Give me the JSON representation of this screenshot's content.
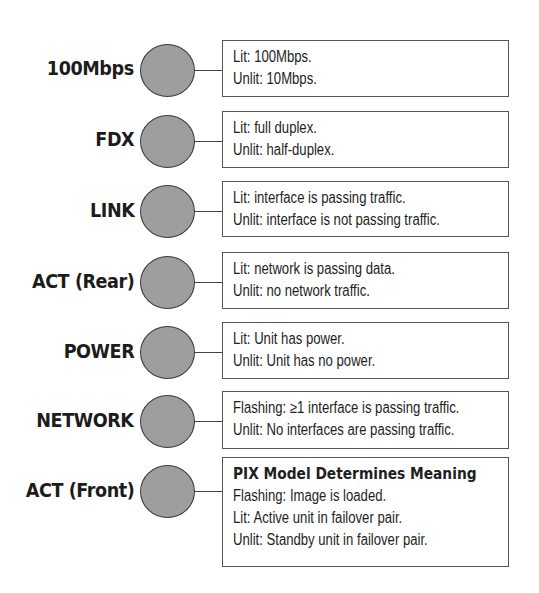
{
  "diagram": {
    "type": "LED indicator legend",
    "indicators": [
      {
        "label": "100Mbps",
        "lines": [
          "Lit: 100Mbps.",
          "Unlit:  10Mbps."
        ]
      },
      {
        "label": "FDX",
        "lines": [
          "Lit:  full duplex.",
          "Unlit:  half-duplex."
        ]
      },
      {
        "label": "LINK",
        "lines": [
          "Lit:  interface is passing traffic.",
          "Unlit: interface is not passing traffic."
        ]
      },
      {
        "label": "ACT (Rear)",
        "lines": [
          "Lit: network is passing data.",
          "Unlit:  no network traffic."
        ]
      },
      {
        "label": "POWER",
        "lines": [
          "Lit: Unit has power.",
          "Unlit:  Unit has no power."
        ]
      },
      {
        "label": "NETWORK",
        "lines": [
          "Flashing: ≥1 interface is passing traffic.",
          "Unlit:  No interfaces are passing traffic."
        ]
      },
      {
        "label": "ACT (Front)",
        "title": "PIX Model Determines Meaning",
        "lines": [
          "Flashing: Image is loaded.",
          "Lit: Active unit in failover pair.",
          "Unlit: Standby unit in failover pair."
        ]
      }
    ],
    "colors": {
      "led_fill": "#9e9e9e",
      "led_border": "#3a3a3a",
      "box_border": "#555555",
      "text": "#1a1a1a"
    }
  }
}
